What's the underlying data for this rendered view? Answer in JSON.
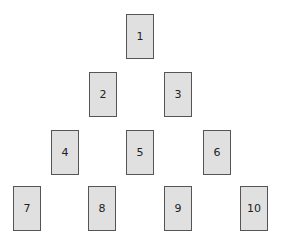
{
  "diagram": {
    "type": "card-spread-pyramid",
    "cards": [
      {
        "label": "1",
        "x": 126,
        "y": 14
      },
      {
        "label": "2",
        "x": 89,
        "y": 72
      },
      {
        "label": "3",
        "x": 164,
        "y": 72
      },
      {
        "label": "4",
        "x": 51,
        "y": 130
      },
      {
        "label": "5",
        "x": 126,
        "y": 130
      },
      {
        "label": "6",
        "x": 203,
        "y": 130
      },
      {
        "label": "7",
        "x": 13,
        "y": 186
      },
      {
        "label": "8",
        "x": 88,
        "y": 186
      },
      {
        "label": "9",
        "x": 164,
        "y": 186
      },
      {
        "label": "10",
        "x": 240,
        "y": 186
      }
    ]
  }
}
